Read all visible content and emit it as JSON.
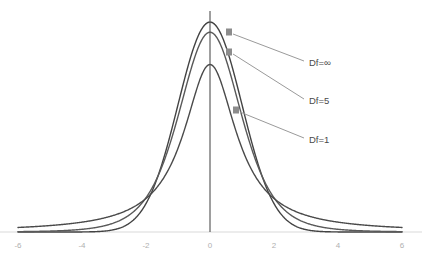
{
  "chart_data": {
    "type": "line",
    "title": "",
    "subtitle": "",
    "xlabel": "",
    "ylabel": "",
    "xlim": [
      -6,
      6
    ],
    "ylim": [
      0,
      0.42
    ],
    "grid": false,
    "legend_position": "inline-annotations",
    "x_ticks": [
      -6,
      -4,
      -2,
      0,
      2,
      4,
      6
    ],
    "x_tick_labels": [
      "-6",
      "-4",
      "-2",
      "0",
      "2",
      "4",
      "6"
    ],
    "y_ticks": [],
    "y_tick_labels": [],
    "axis_line_color": "#d9d9d9",
    "vertical_center_line": {
      "x": 0,
      "color": "#3f3f3f"
    },
    "series": [
      {
        "name": "Df=∞",
        "label": "Df=∞",
        "df": "inf",
        "color": "#434343",
        "peak_value": 0.3989,
        "x": [
          -6,
          -5.5,
          -5,
          -4.5,
          -4,
          -3.5,
          -3,
          -2.5,
          -2,
          -1.75,
          -1.5,
          -1.25,
          -1,
          -0.75,
          -0.5,
          -0.25,
          0,
          0.25,
          0.5,
          0.75,
          1,
          1.25,
          1.5,
          1.75,
          2,
          2.5,
          3,
          3.5,
          4,
          4.5,
          5,
          5.5,
          6
        ],
        "values": [
          0.0,
          0.0001,
          0.0,
          0.0,
          0.0001,
          0.0009,
          0.0044,
          0.0175,
          0.054,
          0.0863,
          0.1295,
          0.1826,
          0.242,
          0.3011,
          0.3521,
          0.3867,
          0.3989,
          0.3867,
          0.3521,
          0.3011,
          0.242,
          0.1826,
          0.1295,
          0.0863,
          0.054,
          0.0175,
          0.0044,
          0.0009,
          0.0001,
          0.0,
          0.0,
          0.0001,
          0.0
        ]
      },
      {
        "name": "Df=5",
        "label": "Df=5",
        "df": 5,
        "color": "#595959",
        "peak_value": 0.3796,
        "x": [
          -6,
          -5.5,
          -5,
          -4.5,
          -4,
          -3.5,
          -3,
          -2.5,
          -2,
          -1.75,
          -1.5,
          -1.25,
          -1,
          -0.75,
          -0.5,
          -0.25,
          0,
          0.25,
          0.5,
          0.75,
          1,
          1.25,
          1.5,
          1.75,
          2,
          2.5,
          3,
          3.5,
          4,
          4.5,
          5,
          5.5,
          6
        ],
        "values": [
          0.001,
          0.0014,
          0.002,
          0.0029,
          0.0051,
          0.0089,
          0.0173,
          0.034,
          0.0651,
          0.0863,
          0.112,
          0.1415,
          0.1733,
          0.2059,
          0.2356,
          0.2592,
          0.3796,
          0.2592,
          0.2356,
          0.2059,
          0.1733,
          0.1415,
          0.112,
          0.0863,
          0.0651,
          0.034,
          0.0173,
          0.0089,
          0.0051,
          0.0029,
          0.002,
          0.0014,
          0.001
        ]
      },
      {
        "name": "Df=1",
        "label": "Df=1",
        "df": 1,
        "color": "#4a4a4a",
        "peak_value": 0.3183,
        "x": [
          -6,
          -5.5,
          -5,
          -4.5,
          -4,
          -3.5,
          -3,
          -2.5,
          -2,
          -1.75,
          -1.5,
          -1.25,
          -1,
          -0.75,
          -0.5,
          -0.25,
          0,
          0.25,
          0.5,
          0.75,
          1,
          1.25,
          1.5,
          1.75,
          2,
          2.5,
          3,
          3.5,
          4,
          4.5,
          5,
          5.5,
          6
        ],
        "values": [
          0.0086,
          0.0102,
          0.0122,
          0.015,
          0.0187,
          0.0241,
          0.0318,
          0.0438,
          0.0637,
          0.0784,
          0.0979,
          0.1238,
          0.1592,
          0.2037,
          0.2546,
          0.2995,
          0.3183,
          0.2995,
          0.2546,
          0.2037,
          0.1592,
          0.1238,
          0.0979,
          0.0784,
          0.0637,
          0.0438,
          0.0318,
          0.0241,
          0.0187,
          0.015,
          0.0122,
          0.0102,
          0.0086
        ]
      }
    ],
    "annotations": [
      {
        "text": "Df=∞",
        "label_x": 309,
        "label_y": 63,
        "arrow_tip_x": 229,
        "arrow_tip_y": 32,
        "leader_color": "#9a9a9a",
        "marker_color": "#8c8c8c"
      },
      {
        "text": "Df=5",
        "label_x": 309,
        "label_y": 101,
        "arrow_tip_x": 229,
        "arrow_tip_y": 52,
        "leader_color": "#9a9a9a",
        "marker_color": "#8c8c8c"
      },
      {
        "text": "Df=1",
        "label_x": 309,
        "label_y": 140,
        "arrow_tip_x": 236,
        "arrow_tip_y": 110,
        "leader_color": "#9a9a9a",
        "marker_color": "#8c8c8c"
      }
    ]
  }
}
